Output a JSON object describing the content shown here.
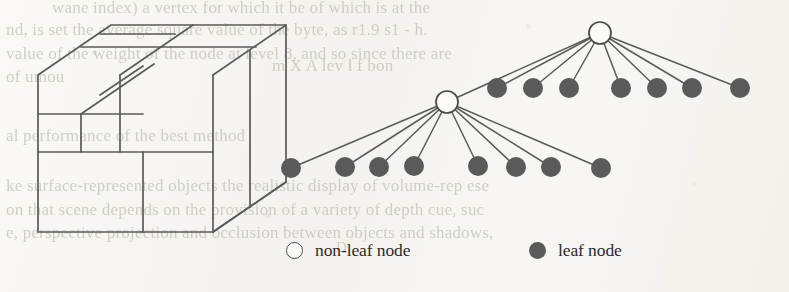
{
  "figure": {
    "type": "octree-subdivision-diagram",
    "stroke_color": "#5a5a5a",
    "node_fill_color": "#5a5a5a",
    "node_open_fill": "#fbfaf8",
    "background_color": "#f7f6f3",
    "bleed_text_color": "#b9b4ac"
  },
  "legend": {
    "entries": [
      {
        "marker": "open-circle-icon",
        "label": "non-leaf node"
      },
      {
        "marker": "filled-circle-icon",
        "label": "leaf node"
      }
    ]
  },
  "cube": {
    "name": "subdivided-cube",
    "front_face": {
      "x": 38,
      "y": 75,
      "w": 175,
      "h": 157
    },
    "top_face_offset": {
      "dx": 73,
      "dy": -50
    },
    "outline": [
      [
        38,
        75
      ],
      [
        111,
        25
      ],
      [
        286,
        25
      ],
      [
        286,
        182
      ],
      [
        213,
        232
      ],
      [
        38,
        232
      ]
    ],
    "internal_lines": [
      {
        "name": "front-vertical-mid",
        "x1": 120,
        "y1": 75,
        "x2": 120,
        "y2": 152
      },
      {
        "name": "front-vertical-center",
        "x1": 143,
        "y1": 152,
        "x2": 143,
        "y2": 232
      },
      {
        "name": "front-horizontal-mid",
        "x1": 38,
        "y1": 152,
        "x2": 213,
        "y2": 152
      },
      {
        "name": "front-horizontal-quarter",
        "x1": 38,
        "y1": 114,
        "x2": 143,
        "y2": 114
      },
      {
        "name": "front-vertical-quarter",
        "x1": 81,
        "y1": 114,
        "x2": 81,
        "y2": 152
      },
      {
        "name": "front-vertical-right",
        "x1": 213,
        "y1": 75,
        "x2": 213,
        "y2": 232
      },
      {
        "name": "top-edge-mid-h",
        "x1": 81,
        "y1": 47,
        "x2": 256,
        "y2": 47
      },
      {
        "name": "top-edge-quarter-h",
        "x1": 100,
        "y1": 34,
        "x2": 175,
        "y2": 34
      },
      {
        "name": "top-diag-left",
        "x1": 81,
        "y1": 114,
        "x2": 154,
        "y2": 64
      },
      {
        "name": "top-diag-center",
        "x1": 120,
        "y1": 75,
        "x2": 193,
        "y2": 25
      },
      {
        "name": "top-diag-quarter",
        "x1": 100,
        "y1": 95,
        "x2": 143,
        "y2": 66
      },
      {
        "name": "right-diag-top",
        "x1": 213,
        "y1": 75,
        "x2": 286,
        "y2": 25
      },
      {
        "name": "right-diag-bottom",
        "x1": 213,
        "y1": 232,
        "x2": 286,
        "y2": 182
      },
      {
        "name": "right-face-vertical",
        "x1": 250,
        "y1": 50,
        "x2": 250,
        "y2": 207
      }
    ]
  },
  "tree": {
    "name": "octree-node-tree",
    "root": {
      "id": "root",
      "kind": "non-leaf",
      "x": 600,
      "y": 33,
      "r": 11
    },
    "level1": {
      "non_leaf": {
        "id": "n1",
        "kind": "non-leaf",
        "x": 447,
        "y": 102,
        "r": 11
      },
      "leaves": [
        {
          "id": "l1-1",
          "kind": "leaf",
          "x": 497,
          "y": 88,
          "r": 10
        },
        {
          "id": "l1-2",
          "kind": "leaf",
          "x": 533,
          "y": 88,
          "r": 10
        },
        {
          "id": "l1-3",
          "kind": "leaf",
          "x": 569,
          "y": 88,
          "r": 10
        },
        {
          "id": "l1-4",
          "kind": "leaf",
          "x": 621,
          "y": 88,
          "r": 10
        },
        {
          "id": "l1-5",
          "kind": "leaf",
          "x": 657,
          "y": 88,
          "r": 10
        },
        {
          "id": "l1-6",
          "kind": "leaf",
          "x": 692,
          "y": 88,
          "r": 10
        },
        {
          "id": "l1-7",
          "kind": "leaf",
          "x": 740,
          "y": 88,
          "r": 10
        }
      ]
    },
    "level2": {
      "leaves": [
        {
          "id": "l2-1",
          "kind": "leaf",
          "x": 291,
          "y": 168,
          "r": 10
        },
        {
          "id": "l2-2",
          "kind": "leaf",
          "x": 345,
          "y": 167,
          "r": 10
        },
        {
          "id": "l2-3",
          "kind": "leaf",
          "x": 379,
          "y": 167,
          "r": 10
        },
        {
          "id": "l2-4",
          "kind": "leaf",
          "x": 414,
          "y": 166,
          "r": 10
        },
        {
          "id": "l2-5",
          "kind": "leaf",
          "x": 478,
          "y": 166,
          "r": 10
        },
        {
          "id": "l2-6",
          "kind": "leaf",
          "x": 516,
          "y": 167,
          "r": 10
        },
        {
          "id": "l2-7",
          "kind": "leaf",
          "x": 551,
          "y": 167,
          "r": 10
        },
        {
          "id": "l2-8",
          "kind": "leaf",
          "x": 601,
          "y": 168,
          "r": 10
        }
      ]
    },
    "counts": {
      "root_children": 8,
      "level1_leaves": 7,
      "level2_leaves": 8,
      "non_leaf_nodes": 2
    }
  },
  "bleed_text": [
    {
      "text": "wane  index) a  vertex for which it  be  of which is at the",
      "x": 52,
      "y": -2,
      "size": 17
    },
    {
      "text": "nd, is set the average square value of the byte,  as  r1.9  s1   -  h.",
      "x": 6,
      "y": 20,
      "size": 17
    },
    {
      "text": "value of the weight of the node  at level 8, and so  since  there  are",
      "x": 6,
      "y": 44,
      "size": 17
    },
    {
      "text": "of  umou",
      "x": 6,
      "y": 67,
      "size": 17
    },
    {
      "text": "al performance of  the  best  method",
      "x": 6,
      "y": 126,
      "size": 17
    },
    {
      "text": "ke surface-represented objects  the realistic  display  of  volume-rep  ese",
      "x": 6,
      "y": 176,
      "size": 17
    },
    {
      "text": "on that scene depends on the  provision  of  a  variety  of  depth  cue,   suc",
      "x": 6,
      "y": 200,
      "size": 17
    },
    {
      "text": "e,  perspective  projection  and  occlusion  between  objects  and  shadows,",
      "x": 6,
      "y": 223,
      "size": 17
    },
    {
      "text": "m  X  A  lev  l  f  bon",
      "x": 272,
      "y": 56,
      "size": 17
    },
    {
      "text": "D",
      "x": 336,
      "y": 239,
      "size": 15
    }
  ]
}
